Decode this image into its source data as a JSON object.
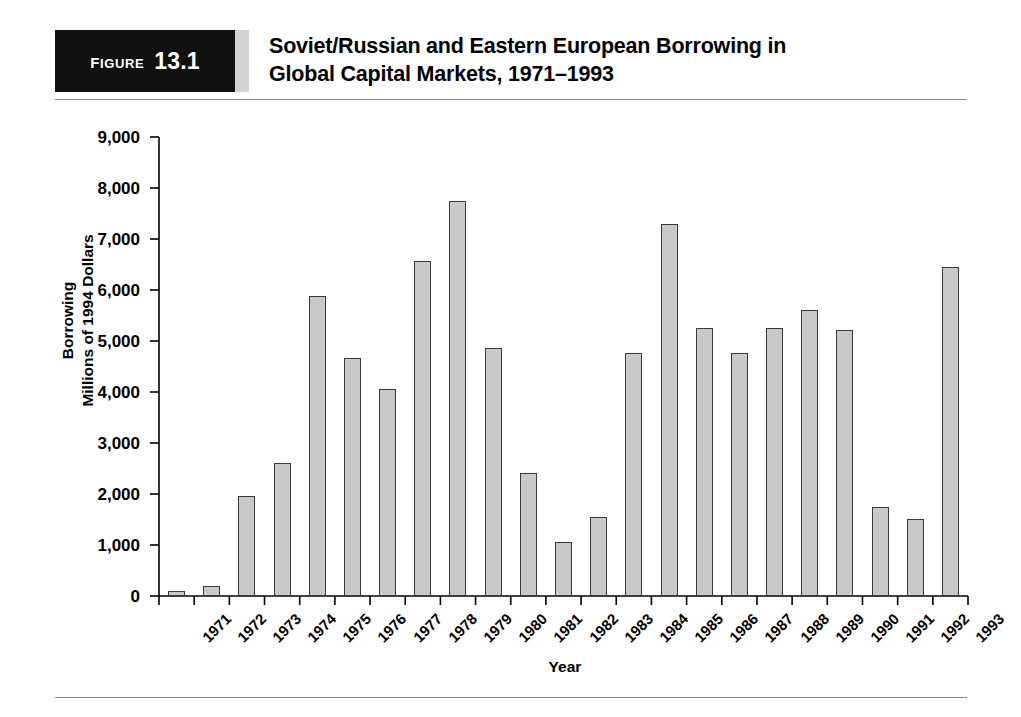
{
  "figure": {
    "tag_word": "Figure",
    "tag_number": "13.1",
    "title_line1": "Soviet/Russian and Eastern European Borrowing in",
    "title_line2": "Global Capital Markets, 1971–1993"
  },
  "colors": {
    "bar_fill": "#c9c9c9",
    "bar_border": "#3a3a3a",
    "tag_background": "#111111",
    "tag_text": "#ffffff",
    "rule": "#8d8d8d",
    "axis": "#000000"
  },
  "chart_data": {
    "type": "bar",
    "title": "Soviet/Russian and Eastern European Borrowing in Global Capital Markets, 1971–1993",
    "xlabel": "Year",
    "ylabel": "Borrowing\nMillions of 1994 Dollars",
    "ylim": [
      0,
      9000
    ],
    "ytick_labels": [
      "0",
      "1,000",
      "2,000",
      "3,000",
      "4,000",
      "5,000",
      "6,000",
      "7,000",
      "8,000",
      "9,000"
    ],
    "yticks": [
      0,
      1000,
      2000,
      3000,
      4000,
      5000,
      6000,
      7000,
      8000,
      9000
    ],
    "grid": false,
    "legend": null,
    "categories": [
      "1971",
      "1972",
      "1973",
      "1974",
      "1975",
      "1976",
      "1977",
      "1978",
      "1979",
      "1980",
      "1981",
      "1982",
      "1983",
      "1984",
      "1985",
      "1986",
      "1987",
      "1988",
      "1989",
      "1990",
      "1991",
      "1992",
      "1993"
    ],
    "values": [
      100,
      190,
      1955,
      2600,
      5890,
      4660,
      4060,
      6560,
      7740,
      4860,
      2420,
      1060,
      1545,
      4760,
      7290,
      5260,
      4755,
      5260,
      5600,
      5210,
      1750,
      1515,
      6460
    ]
  }
}
